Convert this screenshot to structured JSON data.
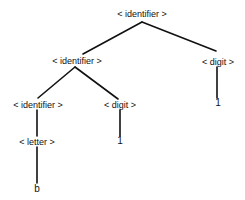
{
  "diagram": {
    "type": "parse-tree",
    "nodes": [
      {
        "id": "n0",
        "label": "< identifier >",
        "x": 142,
        "y": 14
      },
      {
        "id": "n1",
        "label": "< identifier >",
        "x": 77,
        "y": 61
      },
      {
        "id": "n2",
        "label": "< digit >",
        "x": 218,
        "y": 62
      },
      {
        "id": "n3",
        "label": "1",
        "x": 218,
        "y": 103
      },
      {
        "id": "n4",
        "label": "< identifier >",
        "x": 38,
        "y": 105
      },
      {
        "id": "n5",
        "label": "< digit >",
        "x": 120,
        "y": 105
      },
      {
        "id": "n6",
        "label": "< letter >",
        "x": 37,
        "y": 142
      },
      {
        "id": "n7",
        "label": "1",
        "x": 120,
        "y": 141
      },
      {
        "id": "n8",
        "label": "b",
        "x": 37,
        "y": 189
      }
    ],
    "edges": [
      {
        "from": "n0",
        "to": "n1"
      },
      {
        "from": "n0",
        "to": "n2"
      },
      {
        "from": "n2",
        "to": "n3"
      },
      {
        "from": "n1",
        "to": "n4"
      },
      {
        "from": "n1",
        "to": "n5"
      },
      {
        "from": "n4",
        "to": "n6"
      },
      {
        "from": "n5",
        "to": "n7"
      },
      {
        "from": "n6",
        "to": "n8"
      }
    ],
    "colors": {
      "ink": "#111111",
      "background": "#ffffff"
    }
  }
}
